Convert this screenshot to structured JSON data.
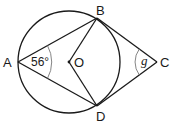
{
  "diagram": {
    "type": "circle-geometry",
    "points": {
      "A": {
        "label": "A"
      },
      "B": {
        "label": "B"
      },
      "C": {
        "label": "C"
      },
      "D": {
        "label": "D"
      },
      "O": {
        "label": "O"
      }
    },
    "segments": [
      "AB",
      "AD",
      "OB",
      "OD",
      "BC",
      "DC"
    ],
    "angles": {
      "BAD": {
        "label": "56°",
        "value_degrees": 56
      },
      "BCD": {
        "label": "g",
        "unknown": true
      }
    },
    "colors": {
      "stroke": "#1a1a1a",
      "arc": "#777777",
      "background": "#ffffff"
    }
  }
}
